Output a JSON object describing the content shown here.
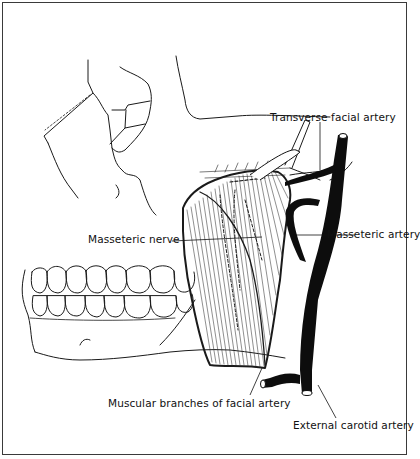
{
  "figure": {
    "line_color": "#111111",
    "background": "#ffffff"
  },
  "labels": {
    "transverse_facial_artery": "Transverse facial artery",
    "masseteric_nerve": "Masseteric nerve",
    "masseteric_artery": "Masseteric artery",
    "muscular_branches": "Muscular branches of facial artery",
    "external_carotid_artery": "External carotid artery"
  }
}
